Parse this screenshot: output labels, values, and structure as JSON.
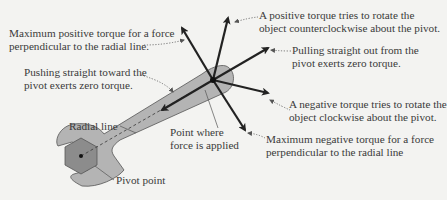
{
  "diagram": {
    "colors": {
      "background": "#f3f3f1",
      "wrench_fill": "#b4b4b4",
      "wrench_stroke": "#555555",
      "nut_fill": "#8c8c8c",
      "arrow": "#222222",
      "text": "#3a3a3a"
    },
    "labels": {
      "max_positive": [
        "Maximum positive torque for a force",
        "perpendicular to the radial line."
      ],
      "pushing": [
        "Pushing straight toward the",
        "pivot exerts zero torque."
      ],
      "radial_line": "Radial line",
      "pivot_point": "Pivot point",
      "point_applied": [
        "Point where",
        "force is applied"
      ],
      "positive_torque": [
        "A positive torque tries to rotate the",
        "object counterclockwise about the pivot."
      ],
      "pulling": [
        "Pulling straight out from the",
        "pivot exerts zero torque."
      ],
      "negative_torque": [
        "A negative torque tries to rotate the",
        "object clockwise about the pivot."
      ],
      "max_negative": [
        "Maximum negative torque for a force",
        "perpendicular to the radial line"
      ]
    }
  }
}
